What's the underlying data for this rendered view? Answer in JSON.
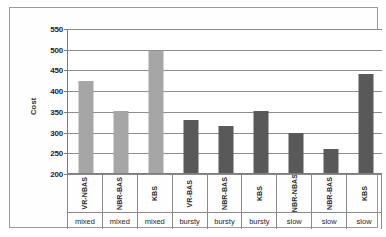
{
  "chart_data": {
    "type": "bar",
    "title": "",
    "xlabel": "",
    "ylabel": "Cost",
    "ylim": [
      200,
      550
    ],
    "ytick_step": 50,
    "yticks": [
      550,
      500,
      450,
      400,
      350,
      300,
      250,
      200
    ],
    "grid": true,
    "legend": "none",
    "categories": [
      "VR-NBAS",
      "NBR-BAS",
      "KBS",
      "VR-BAS",
      "NBR-BAS",
      "KBS",
      "NBR-NBAS",
      "NBR-BAS",
      "KBS"
    ],
    "groups": [
      "mixed",
      "mixed",
      "mixed",
      "bursty",
      "bursty",
      "bursty",
      "slow",
      "slow",
      "slow"
    ],
    "values": [
      422,
      350,
      495,
      328,
      313,
      350,
      297,
      257,
      440
    ],
    "bar_colors": [
      "#a6a6a6",
      "#a6a6a6",
      "#a6a6a6",
      "#595959",
      "#595959",
      "#595959",
      "#595959",
      "#595959",
      "#595959"
    ],
    "axis_color": "#7d7d7d",
    "gridline_color": "#8d8d8d",
    "plot_background": "#ffffff",
    "frame_border_color": "#9a9a9a"
  }
}
